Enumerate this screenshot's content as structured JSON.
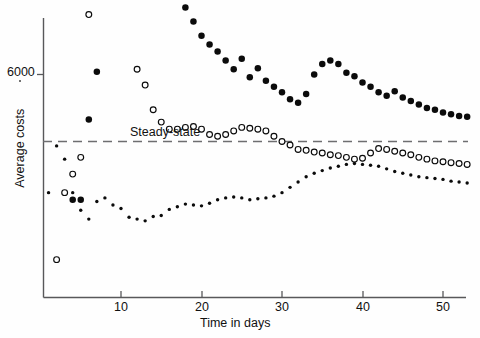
{
  "chart_data": {
    "type": "scatter",
    "title": "",
    "xlabel": "Time in days",
    "ylabel": "Average costs",
    "xlim": [
      0,
      54
    ],
    "ylim": [
      4400,
      7050
    ],
    "grid": false,
    "legend_position": "none",
    "annotations": [
      {
        "text": "Steady-state",
        "type": "reference-line-label",
        "y": 5620
      }
    ],
    "reference_lines": [
      {
        "name": "steady-state",
        "orientation": "horizontal",
        "value": 5620,
        "style": "dashed"
      }
    ],
    "xticks": [
      10,
      20,
      30,
      40,
      50
    ],
    "xticklabels": [
      "10",
      "20",
      "30",
      "40",
      "50"
    ],
    "yticks": [
      6000
    ],
    "yticklabels": [
      "6000"
    ],
    "x": [
      1,
      2,
      3,
      4,
      5,
      6,
      7,
      8,
      9,
      10,
      11,
      12,
      13,
      14,
      15,
      16,
      17,
      18,
      19,
      20,
      21,
      22,
      23,
      24,
      25,
      26,
      27,
      28,
      29,
      30,
      31,
      32,
      33,
      34,
      35,
      36,
      37,
      38,
      39,
      40,
      41,
      42,
      43,
      44,
      45,
      46,
      47,
      48,
      49,
      50,
      51,
      52,
      53
    ],
    "series": [
      {
        "name": "large-filled-circles",
        "marker": "filled-circle-large",
        "values": [
          4580,
          4700,
          4690,
          5290,
          5290,
          5745,
          6015,
          6400,
          6520,
          6800,
          6990,
          6800,
          6805,
          6795,
          6740,
          6540,
          6400,
          6380,
          6300,
          6220,
          6170,
          6130,
          6080,
          6030,
          6090,
          5985,
          6035,
          5965,
          5930,
          5900,
          5860,
          5840,
          5890,
          6000,
          6060,
          6080,
          6060,
          6010,
          5990,
          5955,
          5930,
          5900,
          5880,
          5905,
          5870,
          5850,
          5830,
          5810,
          5800,
          5785,
          5775,
          5765,
          5760
        ]
      },
      {
        "name": "open-circles",
        "marker": "open-circle",
        "values": [
          4430,
          4950,
          5330,
          5435,
          5530,
          6340,
          6540,
          6790,
          6745,
          6520,
          6430,
          6030,
          5940,
          5800,
          5730,
          5690,
          5690,
          5700,
          5705,
          5690,
          5660,
          5650,
          5660,
          5680,
          5700,
          5695,
          5690,
          5680,
          5650,
          5620,
          5600,
          5575,
          5570,
          5560,
          5555,
          5545,
          5540,
          5530,
          5520,
          5525,
          5555,
          5580,
          5575,
          5565,
          5555,
          5545,
          5530,
          5520,
          5510,
          5505,
          5500,
          5495,
          5490
        ]
      },
      {
        "name": "small-filled-dots",
        "marker": "filled-dot-small",
        "values": [
          5330,
          5595,
          5520,
          5330,
          5230,
          5180,
          5280,
          5300,
          5260,
          5240,
          5190,
          5180,
          5170,
          5195,
          5200,
          5235,
          5250,
          5265,
          5260,
          5255,
          5270,
          5290,
          5300,
          5305,
          5300,
          5290,
          5295,
          5300,
          5310,
          5330,
          5360,
          5390,
          5420,
          5440,
          5455,
          5470,
          5480,
          5490,
          5495,
          5490,
          5485,
          5480,
          5465,
          5450,
          5440,
          5430,
          5420,
          5415,
          5410,
          5405,
          5395,
          5390,
          5385
        ]
      }
    ]
  },
  "axis": {
    "y_label": "Average costs",
    "x_label": "Time in days",
    "y_tick_6000": "6000",
    "x_tick_10": "10",
    "x_tick_20": "20",
    "x_tick_30": "30",
    "x_tick_40": "40",
    "x_tick_50": "50"
  },
  "annotation": {
    "steady_state": "Steady-state"
  },
  "colors": {
    "ink": "#0b0b0b",
    "axis": "#58585a",
    "dash": "#6e6e70",
    "background": "#fefefe"
  }
}
